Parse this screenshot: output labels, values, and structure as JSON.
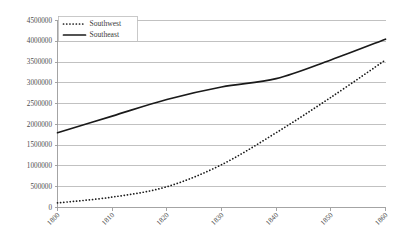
{
  "chart_data": {
    "type": "line",
    "title": "",
    "subtitle": "",
    "xlabel": "",
    "ylabel": "",
    "x": [
      1800,
      1810,
      1820,
      1830,
      1840,
      1850,
      1860
    ],
    "categories": [
      "1800",
      "1810",
      "1820",
      "1830",
      "1840",
      "1850",
      "1860"
    ],
    "series": [
      {
        "name": "Southwest",
        "style": "dotted",
        "color": "#1a1a1a",
        "values": [
          110000,
          250000,
          500000,
          1030000,
          1800000,
          2650000,
          3550000
        ]
      },
      {
        "name": "Southeast",
        "style": "solid",
        "color": "#1a1a1a",
        "values": [
          1800000,
          2200000,
          2600000,
          2900000,
          3100000,
          3550000,
          4050000
        ]
      }
    ],
    "ylim": [
      0,
      4500000
    ],
    "xlim": [
      1800,
      1860
    ],
    "ytick_values": [
      0,
      500000,
      1000000,
      1500000,
      2000000,
      2500000,
      3000000,
      3500000,
      4000000,
      4500000
    ],
    "ytick_labels": [
      "0",
      "500000",
      "1000000",
      "1500000",
      "2000000",
      "2500000",
      "3000000",
      "3500000",
      "4000000",
      "4500000"
    ],
    "xtick_labels": [
      "1800",
      "1810",
      "1820",
      "1830",
      "1840",
      "1850",
      "1860"
    ],
    "grid": true,
    "grid_axis": "y",
    "legend_position": "top-left",
    "legend_entries": [
      "Southwest",
      "Southeast"
    ],
    "xtick_label_rotation": -45
  }
}
